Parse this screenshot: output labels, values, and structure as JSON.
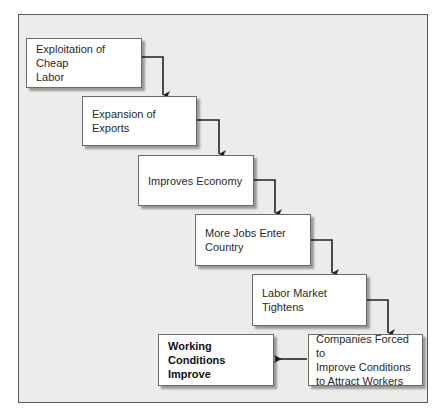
{
  "diagram": {
    "type": "flowchart",
    "nodes": [
      {
        "id": "n1",
        "label": "Exploitation of Cheap Labor",
        "lines": [
          "Exploitation of Cheap",
          "Labor"
        ]
      },
      {
        "id": "n2",
        "label": "Expansion of Exports",
        "lines": [
          "Expansion of",
          "Exports"
        ]
      },
      {
        "id": "n3",
        "label": "Improves Economy",
        "lines": [
          "Improves Economy"
        ]
      },
      {
        "id": "n4",
        "label": "More Jobs Enter Country",
        "lines": [
          "More Jobs Enter",
          "Country"
        ]
      },
      {
        "id": "n5",
        "label": "Labor Market Tightens",
        "lines": [
          "Labor Market",
          "Tightens"
        ]
      },
      {
        "id": "n6",
        "label": "Companies Forced to Improve Conditions to Attract Workers",
        "lines": [
          "Companies Forced to",
          "Improve Conditions",
          "to Attract Workers"
        ]
      },
      {
        "id": "n7",
        "label": "Working Conditions Improve",
        "lines": [
          "Working",
          "Conditions",
          "Improve"
        ],
        "emphasis": "bold"
      }
    ],
    "edges": [
      {
        "from": "n1",
        "to": "n2"
      },
      {
        "from": "n2",
        "to": "n3"
      },
      {
        "from": "n3",
        "to": "n4"
      },
      {
        "from": "n4",
        "to": "n5"
      },
      {
        "from": "n5",
        "to": "n6"
      },
      {
        "from": "n6",
        "to": "n7"
      }
    ]
  },
  "colors": {
    "frame_bg": "#ececea",
    "frame_border": "#5a5a5a",
    "box_bg": "#ffffff",
    "arrow": "#222222"
  }
}
